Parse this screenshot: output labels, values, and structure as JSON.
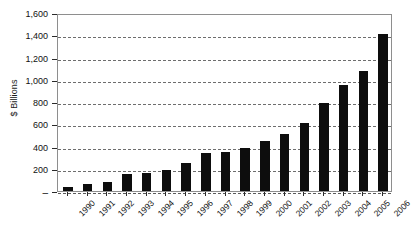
{
  "chart_data": {
    "type": "bar",
    "title": "",
    "xlabel": "",
    "ylabel": "$ Billions",
    "ylim": [
      0,
      1600
    ],
    "ytick_values": [
      0,
      200,
      400,
      600,
      800,
      1000,
      1200,
      1400,
      1600
    ],
    "ytick_labels": [
      "–",
      "200",
      "400",
      "600",
      "800",
      "1,000",
      "1,200",
      "1,400",
      "1,600"
    ],
    "grid": true,
    "legend": "none",
    "bar_color": "#0d0d0d",
    "categories": [
      "1990",
      "1991",
      "1992",
      "1993",
      "1994",
      "1995",
      "1996",
      "1997",
      "1998",
      "1999",
      "2000",
      "2001",
      "2002",
      "2003",
      "2004",
      "2005",
      "2006"
    ],
    "values": [
      40,
      65,
      85,
      155,
      165,
      190,
      250,
      345,
      350,
      390,
      450,
      510,
      610,
      790,
      950,
      1080,
      1410
    ]
  }
}
